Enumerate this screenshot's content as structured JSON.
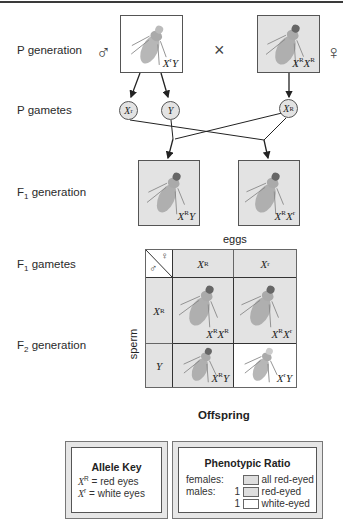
{
  "diagram": {
    "rows": {
      "p_generation": "P generation",
      "p_gametes": "P gametes",
      "f1_generation": "F",
      "f1_generation_sub": "1",
      "f1_generation_rest": " generation",
      "f1_gametes": "F",
      "f1_gametes_sub": "1",
      "f1_gametes_rest": " gametes",
      "f2_generation": "F",
      "f2_generation_sub": "2",
      "f2_generation_rest": " generation"
    },
    "symbols": {
      "male": "♂",
      "female": "♀",
      "cross": "×"
    },
    "p_generation": {
      "male": {
        "base1": "X",
        "sup1": "r",
        "base2": "Y",
        "fill": "#ffffff"
      },
      "female": {
        "base1": "X",
        "sup1": "R",
        "base2": "X",
        "sup2": "R",
        "fill": "#e3e3e3"
      }
    },
    "p_gametes": [
      {
        "base": "X",
        "sup": "r"
      },
      {
        "base": "Y",
        "sup": ""
      },
      {
        "base": "X",
        "sup": "R"
      }
    ],
    "f1_generation": [
      {
        "base1": "X",
        "sup1": "R",
        "base2": "Y",
        "sup2": ""
      },
      {
        "base1": "X",
        "sup1": "R",
        "base2": "X",
        "sup2": "r"
      }
    ],
    "punnett": {
      "eggs_label": "eggs",
      "sperm_label": "sperm",
      "corner_male": "♂",
      "corner_female": "♀",
      "egg_headers": [
        {
          "base": "X",
          "sup": "R"
        },
        {
          "base": "X",
          "sup": "r"
        }
      ],
      "sperm_headers": [
        {
          "base": "X",
          "sup": "R"
        },
        {
          "base": "Y",
          "sup": ""
        }
      ],
      "cells": [
        [
          {
            "base1": "X",
            "sup1": "R",
            "base2": "X",
            "sup2": "R",
            "fill": "#e3e3e3"
          },
          {
            "base1": "X",
            "sup1": "R",
            "base2": "X",
            "sup2": "r",
            "fill": "#e3e3e3"
          }
        ],
        [
          {
            "base1": "X",
            "sup1": "R",
            "base2": "Y",
            "sup2": "",
            "fill": "#e3e3e3"
          },
          {
            "base1": "X",
            "sup1": "r",
            "base2": "Y",
            "sup2": "",
            "fill": "#ffffff"
          }
        ]
      ],
      "offspring_label": "Offspring"
    },
    "allele_key": {
      "title": "Allele Key",
      "entries": [
        {
          "base": "X",
          "sup": "R",
          "eq": " = ",
          "meaning": "red eyes"
        },
        {
          "base": "X",
          "sup": "r",
          "eq": " = ",
          "meaning": "white eyes"
        }
      ]
    },
    "phenotypic_ratio": {
      "title": "Phenotypic Ratio",
      "rows": [
        {
          "group": "females:",
          "count": "",
          "swatch": "gray",
          "label": "all red-eyed"
        },
        {
          "group": "males:",
          "count": "1",
          "swatch": "gray",
          "label": "red-eyed"
        },
        {
          "group": "",
          "count": "1",
          "swatch": "white",
          "label": "white-eyed"
        }
      ]
    },
    "colors": {
      "red_eyed_fill": "#e3e3e3",
      "white_eyed_fill": "#ffffff",
      "border": "#555555"
    }
  }
}
